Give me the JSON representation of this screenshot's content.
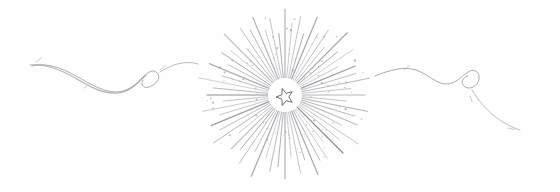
{
  "artwork": {
    "title": "Ornamental Starburst Divider",
    "medium": "pencil line drawing",
    "width": 560,
    "height": 192,
    "background_color": "#fefefe",
    "ink_color": "#8a8a92",
    "ink_color_light": "#b5b5bd",
    "ink_color_dark": "#6e6e78",
    "star_color": "#7a7a84"
  },
  "starburst": {
    "name": "radiant-starburst",
    "center_x": 285,
    "center_y": 95,
    "inner_radius": 14,
    "outer_radius_min": 58,
    "outer_radius_max": 88,
    "ray_count": 64,
    "ray_stroke_width": 0.9,
    "halo_radius": 17,
    "halo_color": "#ffffff",
    "fleck_count": 90,
    "fleck_radius": 0.7,
    "fleck_color": "#9a9aa3",
    "ray_lengths": [
      86,
      72,
      80,
      64,
      84,
      70,
      78,
      62,
      88,
      68,
      82,
      60,
      76,
      74,
      86,
      66,
      80,
      62,
      84,
      72,
      78,
      64,
      88,
      70,
      82,
      60,
      76,
      74,
      86,
      68,
      80,
      62,
      84,
      72,
      78,
      66,
      88,
      64,
      82,
      70,
      76,
      60,
      86,
      74,
      80,
      68,
      84,
      62,
      78,
      72,
      88,
      66,
      82,
      64,
      76,
      70,
      86,
      60,
      80,
      74,
      84,
      68,
      78,
      62
    ]
  },
  "center_star": {
    "name": "five-pointed-star",
    "center_x": 285,
    "center_y": 97,
    "outer_radius": 9,
    "inner_radius": 3.8,
    "points": 5,
    "rotation_deg": -18,
    "stroke_color": "#6e6e78",
    "fill_color": "#ffffff"
  },
  "flourish_left": {
    "name": "left-flourish",
    "path": "M 32 66 C 46 62 62 68 76 76 C 92 85 104 92 116 92 C 128 92 136 84 142 78 C 148 72 154 68 158 74 C 161 79 155 85 149 87 C 143 89 140 84 143 80",
    "tail_path": "M 160 72 C 172 64 186 60 198 64",
    "stroke_width": 1.0,
    "stroke_color": "#9b9ba4"
  },
  "flourish_left_wave": {
    "name": "left-flourish-wave",
    "path": "M 30 65 C 48 63 66 72 82 82 C 96 90 106 94 118 93 C 130 92 139 82 146 75",
    "stroke_width": 1.1,
    "stroke_color": "#a2a2ab"
  },
  "flourish_right": {
    "name": "right-flourish",
    "path": "M 375 76 C 390 70 404 66 416 70 C 428 74 436 84 446 84 C 456 84 462 76 468 72 C 474 68 480 72 479 79 C 478 86 470 90 465 87 C 460 84 462 77 468 76",
    "tail_path": "M 472 90 C 482 106 496 122 520 130",
    "stroke_width": 1.0,
    "stroke_color": "#9b9ba4"
  },
  "accent_marks": [
    {
      "name": "accent-mark-left-1",
      "x": 36,
      "y": 62,
      "angle": -38,
      "length": 7
    },
    {
      "name": "accent-mark-left-2",
      "x": 84,
      "y": 88,
      "angle": -30,
      "length": 6
    },
    {
      "name": "accent-mark-left-3",
      "x": 160,
      "y": 70,
      "angle": -40,
      "length": 7
    },
    {
      "name": "accent-mark-right-1",
      "x": 404,
      "y": 70,
      "angle": -40,
      "length": 7
    },
    {
      "name": "accent-mark-right-2",
      "x": 470,
      "y": 96,
      "angle": 70,
      "length": 6
    },
    {
      "name": "accent-mark-right-3",
      "x": 508,
      "y": 128,
      "angle": 12,
      "length": 7
    }
  ]
}
